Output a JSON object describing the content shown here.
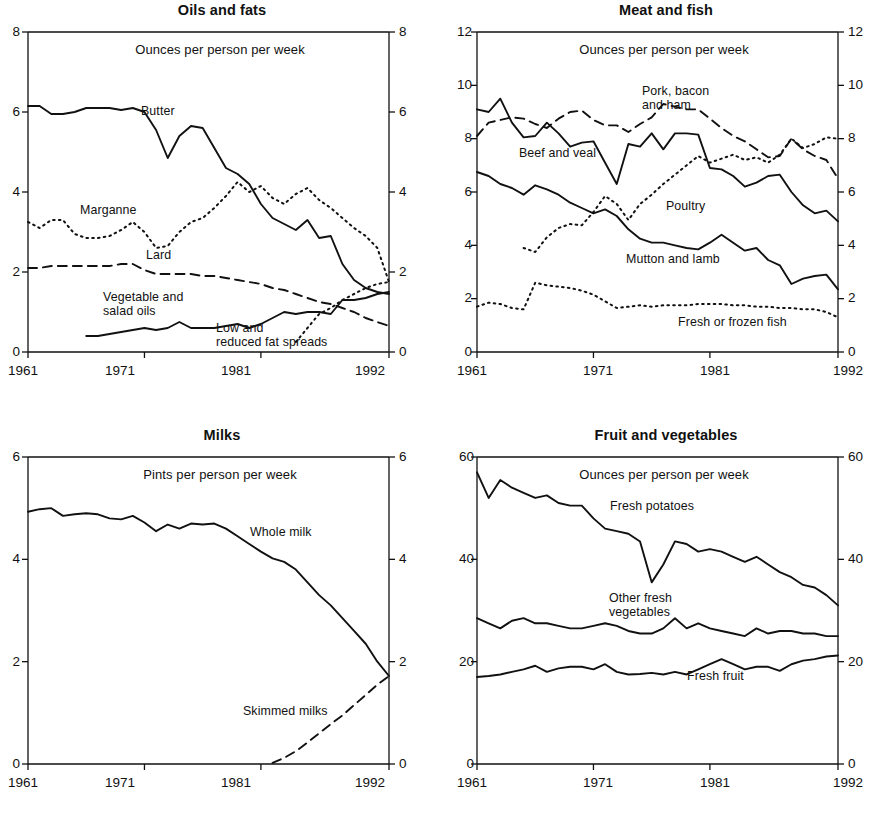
{
  "figure": {
    "axis_color": "#111111",
    "line_color": "#111111",
    "background": "#ffffff"
  },
  "charts": [
    {
      "id": "oils-and-fats",
      "title": "Oils and fats",
      "units_note": "Ounces per person per week",
      "xticks": [
        "1961",
        "1971",
        "1981",
        "1992"
      ],
      "yticks_left": [
        "8",
        "6",
        "4",
        "2",
        "0"
      ],
      "yticks_right": [
        "8",
        "6",
        "4",
        "2",
        "0"
      ],
      "labels": [
        "Butter",
        "Marganne",
        "Lard",
        "Vegetable and\nsalad oils",
        "Low and\nreduced fat spreads"
      ]
    },
    {
      "id": "meat-and-fish",
      "title": "Meat and fish",
      "units_note": "Ounces per person per week",
      "xticks": [
        "1961",
        "1971",
        "1981",
        "1992"
      ],
      "yticks_left": [
        "12",
        "10",
        "8",
        "6",
        "4",
        "2",
        "0"
      ],
      "yticks_right": [
        "12",
        "10",
        "8",
        "6",
        "4",
        "2",
        "0"
      ],
      "labels": [
        "Pork, bacon\nand ham",
        "Beef and veal",
        "Poultry",
        "Mutton and lamb",
        "Fresh or frozen fish"
      ]
    },
    {
      "id": "milks",
      "title": "Milks",
      "units_note": "Pints per person per week",
      "xticks": [
        "1961",
        "1971",
        "1981",
        "1992"
      ],
      "yticks_left": [
        "6",
        "4",
        "2",
        "0"
      ],
      "yticks_right": [
        "6",
        "4",
        "2",
        "0"
      ],
      "labels": [
        "Whole milk",
        "Skimmed milks"
      ]
    },
    {
      "id": "fruit-and-vegetables",
      "title": "Fruit and vegetables",
      "units_note": "Ounces per person per week",
      "xticks": [
        "1961",
        "1971",
        "1981",
        "1992"
      ],
      "yticks_left": [
        "60",
        "40",
        "20",
        "0"
      ],
      "yticks_right": [
        "60",
        "40",
        "20",
        "0"
      ],
      "labels": [
        "Fresh potatoes",
        "Other fresh\nvegetables",
        "Fresh fruit"
      ]
    }
  ],
  "chart_data": [
    {
      "type": "line",
      "title": "Oils and fats",
      "xlabel": "",
      "ylabel": "Ounces per person per week",
      "xlim": [
        1961,
        1992
      ],
      "ylim": [
        0,
        8
      ],
      "yticks": [
        0,
        2,
        4,
        6,
        8
      ],
      "xticks": [
        1961,
        1971,
        1981,
        1992
      ],
      "grid": false,
      "legend": "inline-annotations",
      "x": [
        1961,
        1962,
        1963,
        1964,
        1965,
        1966,
        1967,
        1968,
        1969,
        1970,
        1971,
        1972,
        1973,
        1974,
        1975,
        1976,
        1977,
        1978,
        1979,
        1980,
        1981,
        1982,
        1983,
        1984,
        1985,
        1986,
        1987,
        1988,
        1989,
        1990,
        1991,
        1992
      ],
      "series": [
        {
          "name": "Butter",
          "style": "solid",
          "values": [
            6.15,
            6.15,
            5.95,
            5.95,
            6.0,
            6.1,
            6.1,
            6.1,
            6.05,
            6.1,
            6.0,
            5.55,
            4.85,
            5.4,
            5.65,
            5.6,
            5.1,
            4.6,
            4.45,
            4.2,
            3.7,
            3.35,
            3.2,
            3.05,
            3.3,
            2.85,
            2.9,
            2.2,
            1.8,
            1.6,
            1.5,
            1.45
          ]
        },
        {
          "name": "Marganne",
          "style": "dotted",
          "values": [
            3.25,
            3.1,
            3.3,
            3.3,
            2.95,
            2.85,
            2.85,
            2.9,
            3.05,
            3.25,
            3.0,
            2.6,
            2.65,
            3.0,
            3.25,
            3.35,
            3.6,
            3.9,
            4.25,
            4.0,
            4.15,
            3.85,
            3.7,
            3.95,
            4.1,
            3.8,
            3.6,
            3.35,
            3.1,
            2.9,
            2.6,
            1.75
          ]
        },
        {
          "name": "Lard",
          "style": "dashed",
          "values": [
            2.1,
            2.1,
            2.15,
            2.15,
            2.15,
            2.15,
            2.15,
            2.15,
            2.2,
            2.2,
            2.05,
            1.95,
            1.95,
            1.95,
            1.95,
            1.9,
            1.9,
            1.85,
            1.8,
            1.75,
            1.7,
            1.6,
            1.55,
            1.45,
            1.35,
            1.25,
            1.2,
            1.1,
            1.0,
            0.85,
            0.75,
            0.65
          ]
        },
        {
          "name": "Vegetable and salad oils",
          "style": "solid",
          "values": [
            null,
            null,
            null,
            null,
            null,
            0.4,
            0.4,
            0.45,
            0.5,
            0.55,
            0.6,
            0.55,
            0.6,
            0.75,
            0.6,
            0.6,
            0.6,
            0.65,
            0.7,
            0.6,
            0.7,
            0.85,
            1.0,
            0.95,
            1.0,
            1.0,
            0.95,
            1.3,
            1.3,
            1.35,
            1.45,
            1.5
          ]
        },
        {
          "name": "Low and reduced fat spreads",
          "style": "dotted",
          "values": [
            null,
            null,
            null,
            null,
            null,
            null,
            null,
            null,
            null,
            null,
            null,
            null,
            null,
            null,
            null,
            null,
            null,
            null,
            null,
            null,
            null,
            null,
            null,
            0.25,
            0.6,
            0.95,
            1.1,
            1.3,
            1.45,
            1.6,
            1.7,
            1.75
          ]
        }
      ]
    },
    {
      "type": "line",
      "title": "Meat and fish",
      "xlabel": "",
      "ylabel": "Ounces per person per week",
      "xlim": [
        1961,
        1992
      ],
      "ylim": [
        0,
        12
      ],
      "yticks": [
        0,
        2,
        4,
        6,
        8,
        10,
        12
      ],
      "xticks": [
        1961,
        1971,
        1981,
        1992
      ],
      "grid": false,
      "legend": "inline-annotations",
      "x": [
        1961,
        1962,
        1963,
        1964,
        1965,
        1966,
        1967,
        1968,
        1969,
        1970,
        1971,
        1972,
        1973,
        1974,
        1975,
        1976,
        1977,
        1978,
        1979,
        1980,
        1981,
        1982,
        1983,
        1984,
        1985,
        1986,
        1987,
        1988,
        1989,
        1990,
        1991,
        1992
      ],
      "series": [
        {
          "name": "Beef and veal",
          "style": "solid",
          "values": [
            9.1,
            9.0,
            9.5,
            8.6,
            8.05,
            8.1,
            8.6,
            8.2,
            7.7,
            7.85,
            7.9,
            7.1,
            6.3,
            7.8,
            7.7,
            8.2,
            7.6,
            8.2,
            8.2,
            8.15,
            6.9,
            6.85,
            6.6,
            6.2,
            6.35,
            6.6,
            6.65,
            6.0,
            5.5,
            5.2,
            5.3,
            4.9
          ]
        },
        {
          "name": "Pork, bacon and ham",
          "style": "dashed",
          "values": [
            8.1,
            8.6,
            8.7,
            8.8,
            8.75,
            8.55,
            8.4,
            8.75,
            9.0,
            9.05,
            8.7,
            8.5,
            8.5,
            8.25,
            8.55,
            8.8,
            9.3,
            9.2,
            9.1,
            9.1,
            8.75,
            8.4,
            8.1,
            7.9,
            7.6,
            7.3,
            7.35,
            8.0,
            7.6,
            7.35,
            7.2,
            6.5
          ]
        },
        {
          "name": "Poultry",
          "style": "dotted",
          "values": [
            null,
            null,
            null,
            null,
            3.9,
            3.75,
            4.3,
            4.65,
            4.8,
            4.75,
            5.25,
            5.85,
            5.55,
            4.95,
            5.55,
            5.9,
            6.3,
            6.65,
            7.0,
            7.35,
            7.1,
            7.25,
            7.4,
            7.2,
            7.3,
            7.1,
            7.4,
            8.0,
            7.65,
            7.8,
            8.05,
            8.0
          ]
        },
        {
          "name": "Mutton and lamb",
          "style": "solid",
          "values": [
            6.75,
            6.6,
            6.3,
            6.15,
            5.9,
            6.25,
            6.1,
            5.9,
            5.6,
            5.4,
            5.2,
            5.35,
            5.1,
            4.6,
            4.25,
            4.1,
            4.1,
            4.0,
            3.9,
            3.85,
            4.1,
            4.4,
            4.1,
            3.8,
            3.9,
            3.45,
            3.25,
            2.55,
            2.75,
            2.85,
            2.9,
            2.35
          ]
        },
        {
          "name": "Fresh or frozen fish",
          "style": "dotted",
          "values": [
            1.7,
            1.85,
            1.8,
            1.65,
            1.6,
            2.6,
            2.5,
            2.45,
            2.4,
            2.3,
            2.15,
            1.9,
            1.65,
            1.7,
            1.75,
            1.7,
            1.75,
            1.75,
            1.75,
            1.8,
            1.8,
            1.8,
            1.75,
            1.75,
            1.7,
            1.7,
            1.65,
            1.65,
            1.6,
            1.6,
            1.5,
            1.3
          ]
        }
      ]
    },
    {
      "type": "line",
      "title": "Milks",
      "xlabel": "",
      "ylabel": "Pints per person per week",
      "xlim": [
        1961,
        1992
      ],
      "ylim": [
        0,
        6
      ],
      "yticks": [
        0,
        2,
        4,
        6
      ],
      "xticks": [
        1961,
        1971,
        1981,
        1992
      ],
      "grid": false,
      "legend": "inline-annotations",
      "x": [
        1961,
        1962,
        1963,
        1964,
        1965,
        1966,
        1967,
        1968,
        1969,
        1970,
        1971,
        1972,
        1973,
        1974,
        1975,
        1976,
        1977,
        1978,
        1979,
        1980,
        1981,
        1982,
        1983,
        1984,
        1985,
        1986,
        1987,
        1988,
        1989,
        1990,
        1991,
        1992
      ],
      "series": [
        {
          "name": "Whole milk",
          "style": "solid",
          "values": [
            4.93,
            4.98,
            5.0,
            4.85,
            4.88,
            4.9,
            4.88,
            4.8,
            4.78,
            4.85,
            4.72,
            4.55,
            4.68,
            4.6,
            4.7,
            4.68,
            4.7,
            4.6,
            4.45,
            4.3,
            4.15,
            4.02,
            3.95,
            3.8,
            3.55,
            3.3,
            3.1,
            2.85,
            2.6,
            2.35,
            2.0,
            1.72
          ]
        },
        {
          "name": "Skimmed milks",
          "style": "dashed",
          "values": [
            null,
            null,
            null,
            null,
            null,
            null,
            null,
            null,
            null,
            null,
            null,
            null,
            null,
            null,
            null,
            null,
            null,
            null,
            null,
            null,
            null,
            0.02,
            0.12,
            0.25,
            0.42,
            0.6,
            0.78,
            0.95,
            1.15,
            1.35,
            1.55,
            1.72
          ]
        }
      ]
    },
    {
      "type": "line",
      "title": "Fruit and vegetables",
      "xlabel": "",
      "ylabel": "Ounces per person per week",
      "xlim": [
        1961,
        1992
      ],
      "ylim": [
        0,
        60
      ],
      "yticks": [
        0,
        20,
        40,
        60
      ],
      "xticks": [
        1961,
        1971,
        1981,
        1992
      ],
      "grid": false,
      "legend": "inline-annotations",
      "x": [
        1961,
        1962,
        1963,
        1964,
        1965,
        1966,
        1967,
        1968,
        1969,
        1970,
        1971,
        1972,
        1973,
        1974,
        1975,
        1976,
        1977,
        1978,
        1979,
        1980,
        1981,
        1982,
        1983,
        1984,
        1985,
        1986,
        1987,
        1988,
        1989,
        1990,
        1991,
        1992
      ],
      "series": [
        {
          "name": "Fresh potatoes",
          "style": "solid",
          "values": [
            57.0,
            52.0,
            55.5,
            54.0,
            53.0,
            52.0,
            52.5,
            51.0,
            50.5,
            50.5,
            48.0,
            46.0,
            45.5,
            45.0,
            43.5,
            35.5,
            39.0,
            43.5,
            43.0,
            41.5,
            42.0,
            41.5,
            40.5,
            39.5,
            40.5,
            39.0,
            37.5,
            36.5,
            35.0,
            34.5,
            33.0,
            31.0
          ]
        },
        {
          "name": "Other fresh vegetables",
          "style": "solid",
          "values": [
            28.5,
            27.5,
            26.5,
            28.0,
            28.5,
            27.5,
            27.5,
            27.0,
            26.5,
            26.5,
            27.0,
            27.5,
            27.0,
            26.0,
            25.5,
            25.5,
            26.5,
            28.5,
            26.5,
            27.5,
            26.5,
            26.0,
            25.5,
            25.0,
            26.5,
            25.5,
            26.0,
            26.0,
            25.5,
            25.5,
            25.0,
            25.0
          ]
        },
        {
          "name": "Fresh fruit",
          "style": "solid",
          "values": [
            17.0,
            17.2,
            17.5,
            18.0,
            18.5,
            19.2,
            18.0,
            18.7,
            19.0,
            19.0,
            18.5,
            19.5,
            18.0,
            17.5,
            17.6,
            17.8,
            17.5,
            18.0,
            17.5,
            18.5,
            19.5,
            20.5,
            19.5,
            18.5,
            19.0,
            19.0,
            18.2,
            19.5,
            20.2,
            20.5,
            21.0,
            21.2
          ]
        }
      ]
    }
  ]
}
